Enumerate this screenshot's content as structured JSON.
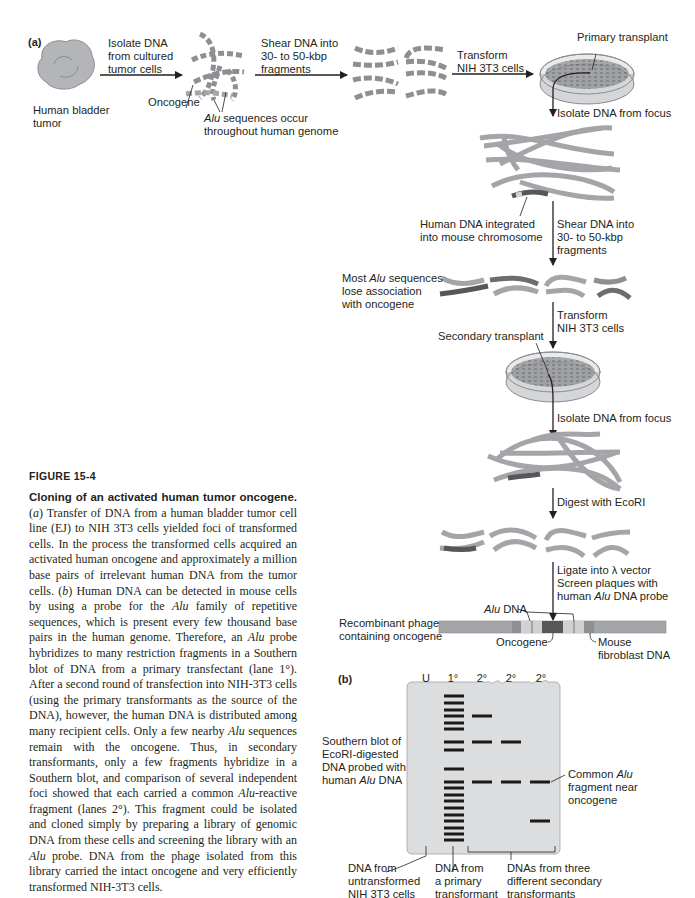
{
  "figure": {
    "number": "FIGURE 15-4",
    "title": "Cloning of an activated human tumor oncogene.",
    "caption_paragraphs": [
      "(a) Transfer of DNA from a human bladder tumor cell line (EJ) to NIH 3T3 cells yielded foci of transformed cells. In the process the transformed cells acquired an activated human oncogene and approximately a million base pairs of irrelevant human DNA from the tumor cells. (b) Human DNA can be detected in mouse cells by using a probe for the Alu family of repetitive sequences, which is present every few thousand base pairs in the human genome. Therefore, an Alu probe hybridizes to many restriction fragments in a Southern blot of DNA from a primary transfectant (lane 1°). After a second round of transfection into NIH-3T3 cells (using the primary transformants as the source of the DNA), however, the human DNA is distributed among many recipient cells. Only a few nearby Alu sequences remain with the oncogene. Thus, in secondary transformants, only a few fragments hybridize in a Southern blot, and comparison of several independent foci showed that each carried a common Alu-reactive fragment (lanes 2°). This fragment could be isolated and cloned simply by preparing a library of genomic DNA from these cells and screening the library with an Alu probe. DNA from the phage isolated from this library carried the intact oncogene and very efficiently transformed NIH-3T3 cells."
    ]
  },
  "panel_a": {
    "tag": "(a)",
    "labels": {
      "tumor": "Human bladder\ntumor",
      "step1": "Isolate DNA\nfrom cultured\ntumor cells",
      "oncogene1": "Oncogene",
      "alu_occur_italic": "Alu",
      "alu_occur_rest": " sequences occur",
      "alu_occur_line2": "throughout human genome",
      "step2": "Shear DNA into\n30- to 50-kbp\nfragments",
      "step3": "Transform\nNIH 3T3 cells",
      "primary": "Primary transplant",
      "step4": "Isolate DNA from focus",
      "integrated": "Human DNA integrated\ninto mouse chromosome",
      "step5": "Shear DNA into\n30- to 50-kbp\nfragments",
      "most_alu_pre": "Most ",
      "most_alu_italic": "Alu",
      "most_alu_rest": " sequences",
      "most_alu_lines": "lose association\nwith oncogene",
      "step6": "Transform\nNIH 3T3 cells",
      "secondary": "Secondary transplant",
      "step7": "Isolate DNA from focus",
      "step8": "Digest with EcoRI",
      "step9_l1": "Ligate into λ vector",
      "step9_l2": "Screen plaques with",
      "step9_l3_pre": "human ",
      "step9_l3_italic": "Alu",
      "step9_l3_rest": " DNA probe",
      "alu_dna_italic": "Alu",
      "alu_dna_rest": " DNA",
      "recombinant": "Recombinant phage\ncontaining oncogene",
      "oncogene2": "Oncogene",
      "mouse": "Mouse\nfibroblast DNA"
    }
  },
  "panel_b": {
    "tag": "(b)",
    "lanes": [
      "U",
      "1°",
      "2°",
      "2°",
      "2°"
    ],
    "left_label_l1": "Southern blot of",
    "left_label_l2": "EcoRI-digested",
    "left_label_l3": "DNA probed with",
    "left_label_l4_pre": "human ",
    "left_label_l4_italic": "Alu",
    "left_label_l4_rest": " DNA",
    "right_label_l1_pre": "Common ",
    "right_label_l1_italic": "Alu",
    "right_label_l2": "fragment near",
    "right_label_l3": "oncogene",
    "bottom_labels": [
      "DNA from\nuntransformed\nNIH 3T3 cells",
      "DNA from\na primary\ntransformant",
      "DNAs from three\ndifferent secondary\ntransformants"
    ],
    "band_rows_lane1": [
      696,
      703,
      710,
      716,
      723,
      729,
      742,
      750,
      769,
      782,
      788,
      795,
      801,
      808,
      815,
      821,
      828,
      834,
      840
    ],
    "band_rows_lane2a": [
      716,
      742,
      782
    ],
    "band_rows_lane2b": [
      742,
      782
    ],
    "band_rows_lane2c": [
      782,
      821
    ],
    "colors": {
      "gel": "#dcdddf",
      "band": "#1a1a1a",
      "dna_strand": "#a3a5a8",
      "oncogene": "#555759",
      "alu": "#cfd1d3"
    }
  }
}
